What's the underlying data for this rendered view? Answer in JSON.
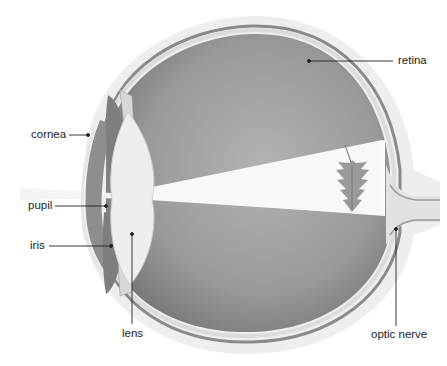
{
  "diagram": {
    "labels": [
      {
        "id": "retina",
        "text": "retina"
      },
      {
        "id": "cornea",
        "text": "cornea"
      },
      {
        "id": "pupil",
        "text": "pupil"
      },
      {
        "id": "iris",
        "text": "iris"
      },
      {
        "id": "lens",
        "text": "lens"
      },
      {
        "id": "optic-nerve",
        "text": "optic nerve"
      }
    ],
    "colors": {
      "background": "#ffffff",
      "sclera_outer": "#ececec",
      "choroid": "#8a8a8a",
      "vitreous_dark": "#8c8c8c",
      "vitreous_light": "#b5b5b5",
      "light_beam": "#f7f7f7",
      "lens": "#eeeeee",
      "label_text": "#222222",
      "leader_line": "#222222"
    }
  }
}
